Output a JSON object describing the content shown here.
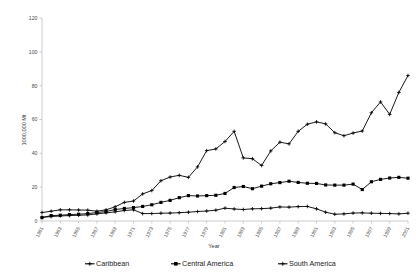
{
  "chart_data": {
    "type": "line",
    "title": "",
    "xlabel": "Year",
    "ylabel": "1000,000 Mt",
    "ylim": [
      0,
      120
    ],
    "yticks": [
      0,
      20,
      40,
      60,
      80,
      100,
      120
    ],
    "grid": false,
    "legend_position": "bottom",
    "x": [
      1961,
      1962,
      1963,
      1964,
      1965,
      1966,
      1967,
      1968,
      1969,
      1970,
      1971,
      1972,
      1973,
      1974,
      1975,
      1976,
      1977,
      1978,
      1979,
      1980,
      1981,
      1982,
      1983,
      1984,
      1985,
      1986,
      1987,
      1988,
      1989,
      1990,
      1991,
      1992,
      1993,
      1994,
      1995,
      1996,
      1997,
      1998,
      1999,
      2000,
      2001
    ],
    "xtick_labels": [
      "1961",
      "1963",
      "1965",
      "1967",
      "1969",
      "1971",
      "1973",
      "1975",
      "1977",
      "1979",
      "1981",
      "1983",
      "1985",
      "1987",
      "1989",
      "1991",
      "1993",
      "1995",
      "1997",
      "1999",
      "2001"
    ],
    "series": [
      {
        "name": "Caribbean",
        "marker": "cross",
        "values": [
          2.2,
          2.6,
          3.0,
          3.2,
          3.4,
          3.6,
          4.2,
          4.8,
          5.4,
          6.2,
          6.6,
          4.4,
          4.4,
          4.6,
          4.7,
          4.9,
          5.2,
          5.6,
          5.9,
          6.4,
          7.6,
          7.1,
          6.8,
          7.2,
          7.3,
          7.6,
          8.3,
          8.2,
          8.5,
          8.6,
          7.2,
          5.2,
          4.0,
          4.2,
          4.7,
          4.8,
          4.6,
          4.5,
          4.4,
          4.2,
          4.6
        ]
      },
      {
        "name": "Central America",
        "marker": "square",
        "values": [
          2.0,
          3.2,
          3.4,
          3.8,
          4.0,
          4.4,
          5.0,
          5.6,
          6.8,
          7.4,
          7.9,
          8.6,
          9.6,
          11.0,
          12.2,
          13.8,
          15.0,
          14.8,
          15.0,
          15.2,
          16.3,
          19.8,
          20.4,
          19.1,
          20.6,
          22.0,
          22.7,
          23.5,
          22.8,
          22.3,
          22.2,
          21.3,
          21.2,
          21.2,
          21.8,
          18.6,
          23.2,
          24.6,
          25.4,
          25.8,
          25.3
        ]
      },
      {
        "name": "South America",
        "marker": "cross",
        "values": [
          5.0,
          5.8,
          6.6,
          6.6,
          6.5,
          6.4,
          5.8,
          6.6,
          8.4,
          11.0,
          11.8,
          16.0,
          18.0,
          23.8,
          26.0,
          27.0,
          25.8,
          32.0,
          41.6,
          42.6,
          47.0,
          53.0,
          37.3,
          36.8,
          32.8,
          41.4,
          46.6,
          45.6,
          53.0,
          57.2,
          58.6,
          57.4,
          52.2,
          50.4,
          52.0,
          53.2,
          64.0,
          70.4,
          63.0,
          76.0,
          86.0
        ]
      }
    ],
    "legend": [
      {
        "label": "Caribbean",
        "marker": "cross",
        "color": "#000000"
      },
      {
        "label": "Central America",
        "marker": "square",
        "color": "#000000"
      },
      {
        "label": "South America",
        "marker": "cross",
        "color": "#000000"
      }
    ]
  },
  "legend": {
    "caribbean": "Caribbean",
    "central_america": "Central America",
    "south_america": "South America"
  },
  "axes": {
    "x_title": "Year",
    "y_title": "1000,000 Mt"
  }
}
